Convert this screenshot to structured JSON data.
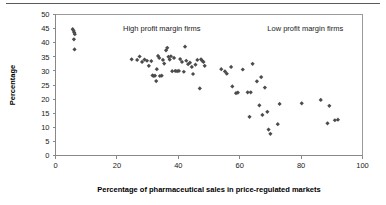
{
  "chart_data": {
    "type": "scatter",
    "title": "",
    "xlabel": "Percentage of pharmaceutical sales in price-regulated markets",
    "ylabel": "Percentage",
    "xlim": [
      0,
      100
    ],
    "ylim": [
      0,
      50
    ],
    "xticks": [
      0,
      20,
      40,
      60,
      80,
      100
    ],
    "yticks": [
      0,
      5,
      10,
      15,
      20,
      25,
      30,
      35,
      40,
      45,
      50
    ],
    "grid": false,
    "legend": "none",
    "marker": "diamond",
    "marker_color": "#4c4c4c",
    "annotations": [
      {
        "text": "High profit margin firms",
        "x": 22,
        "y": 44
      },
      {
        "text": "Low profit margin firms",
        "x": 69,
        "y": 44
      }
    ],
    "series": [
      {
        "name": "Firms",
        "points": [
          [
            5.6,
            44.8
          ],
          [
            5.9,
            44.2
          ],
          [
            6.1,
            43.6
          ],
          [
            6.3,
            43.0
          ],
          [
            6.0,
            41.2
          ],
          [
            6.2,
            37.6
          ],
          [
            24.8,
            34.1
          ],
          [
            26.6,
            33.9
          ],
          [
            27.4,
            35.1
          ],
          [
            28.2,
            33.2
          ],
          [
            29.0,
            34.0
          ],
          [
            29.8,
            33.6
          ],
          [
            30.4,
            31.8
          ],
          [
            31.2,
            33.5
          ],
          [
            31.6,
            28.4
          ],
          [
            32.0,
            28.2
          ],
          [
            32.4,
            28.3
          ],
          [
            32.8,
            26.4
          ],
          [
            33.0,
            30.6
          ],
          [
            33.4,
            35.3
          ],
          [
            33.8,
            34.6
          ],
          [
            34.0,
            28.2
          ],
          [
            34.6,
            28.3
          ],
          [
            35.0,
            33.9
          ],
          [
            35.4,
            32.6
          ],
          [
            36.0,
            37.3
          ],
          [
            36.4,
            38.2
          ],
          [
            36.8,
            35.0
          ],
          [
            37.2,
            34.0
          ],
          [
            37.6,
            35.2
          ],
          [
            38.0,
            29.9
          ],
          [
            38.6,
            34.6
          ],
          [
            39.0,
            30.0
          ],
          [
            39.6,
            29.9
          ],
          [
            40.2,
            30.0
          ],
          [
            40.6,
            34.2
          ],
          [
            41.2,
            33.2
          ],
          [
            41.8,
            29.7
          ],
          [
            42.2,
            38.6
          ],
          [
            42.6,
            33.6
          ],
          [
            43.2,
            32.4
          ],
          [
            43.8,
            32.9
          ],
          [
            44.4,
            31.4
          ],
          [
            44.8,
            28.9
          ],
          [
            45.6,
            32.2
          ],
          [
            46.2,
            33.9
          ],
          [
            47.0,
            23.8
          ],
          [
            47.4,
            34.1
          ],
          [
            47.8,
            33.6
          ],
          [
            48.2,
            33.2
          ],
          [
            48.6,
            31.8
          ],
          [
            54.0,
            30.6
          ],
          [
            55.2,
            29.8
          ],
          [
            55.8,
            29.0
          ],
          [
            57.2,
            31.4
          ],
          [
            57.6,
            24.5
          ],
          [
            58.8,
            22.1
          ],
          [
            59.4,
            22.3
          ],
          [
            61.0,
            30.5
          ],
          [
            62.6,
            22.4
          ],
          [
            63.2,
            13.7
          ],
          [
            63.6,
            22.4
          ],
          [
            64.2,
            32.5
          ],
          [
            65.6,
            26.3
          ],
          [
            66.4,
            17.8
          ],
          [
            67.0,
            27.8
          ],
          [
            67.4,
            14.4
          ],
          [
            68.2,
            24.1
          ],
          [
            69.0,
            15.5
          ],
          [
            69.4,
            9.2
          ],
          [
            70.0,
            7.7
          ],
          [
            72.4,
            11.1
          ],
          [
            73.0,
            18.3
          ],
          [
            80.2,
            18.5
          ],
          [
            86.4,
            19.7
          ],
          [
            88.6,
            11.4
          ],
          [
            89.2,
            17.6
          ],
          [
            91.0,
            12.5
          ],
          [
            92.0,
            12.7
          ]
        ]
      }
    ]
  },
  "axes": {
    "y_title": "Percentage",
    "x_title": "Percentage of pharmaceutical sales in price-regulated markets"
  }
}
